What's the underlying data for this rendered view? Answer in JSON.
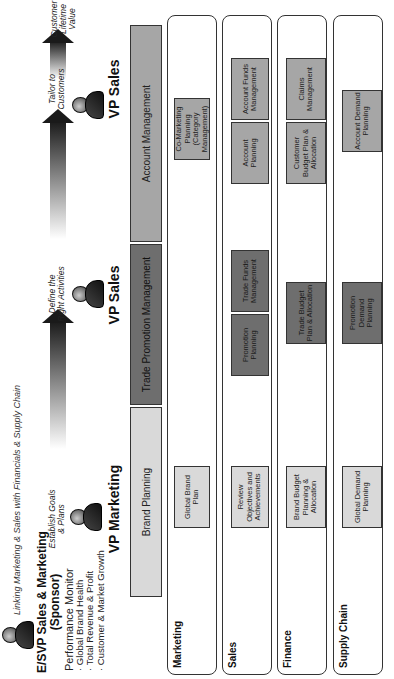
{
  "header": {
    "sponsor": {
      "title_line1": "E/SVP Sales & Marketing",
      "title_line2": "(Sponsor)",
      "monitor_title": "Performance Monitor",
      "monitor_items": [
        "· Global Brand Health",
        "· Total Revenue & Profit",
        "· Customer & Market Growth"
      ]
    },
    "linking_text": "Linking Marketing & Sales with Financials & Supply Chain",
    "steps": [
      {
        "line1": "Establish Goals",
        "line2": "& Plans"
      },
      {
        "line1": "Define the",
        "line2": "Right Activities"
      },
      {
        "line1": "Tailor to",
        "line2": "Customers"
      },
      {
        "line1": "Customer",
        "line2": "Lifetime",
        "line3": "Value"
      }
    ],
    "roles": [
      "VP Marketing",
      "VP Sales",
      "VP Sales"
    ]
  },
  "bands": [
    {
      "label": "Brand Planning",
      "shade": "light"
    },
    {
      "label": "Trade Promotion Management",
      "shade": "dark"
    },
    {
      "label": "Account Management",
      "shade": "mid"
    }
  ],
  "lanes": [
    {
      "label": "Marketing",
      "boxes": [
        {
          "text": "Global Brand Plan"
        },
        {
          "text": "Co-Marketing Planning (Category Management)"
        }
      ]
    },
    {
      "label": "Sales",
      "boxes": [
        {
          "text": "Review Objectives and Achievements"
        },
        {
          "text": "Promotion Planning"
        },
        {
          "text": "Trade Funds Management"
        },
        {
          "text": "Account Planning"
        },
        {
          "text": "Account Funds Management"
        }
      ]
    },
    {
      "label": "Finance",
      "boxes": [
        {
          "text": "Brand Budget Planning & Allocation"
        },
        {
          "text": "Trade Budget Plan & Allocation"
        },
        {
          "text": "Customer Budget Plan & Allocation"
        },
        {
          "text": "Claims Management"
        }
      ]
    },
    {
      "label": "Supply Chain",
      "boxes": [
        {
          "text": "Global Demand Planning"
        },
        {
          "text": "Promotion Demand Planning"
        },
        {
          "text": "Account Demand Planning"
        }
      ]
    }
  ],
  "colors": {
    "light": "#d9d9d9",
    "mid": "#a6a6a6",
    "dark": "#6e6e6e",
    "border": "#333333"
  }
}
